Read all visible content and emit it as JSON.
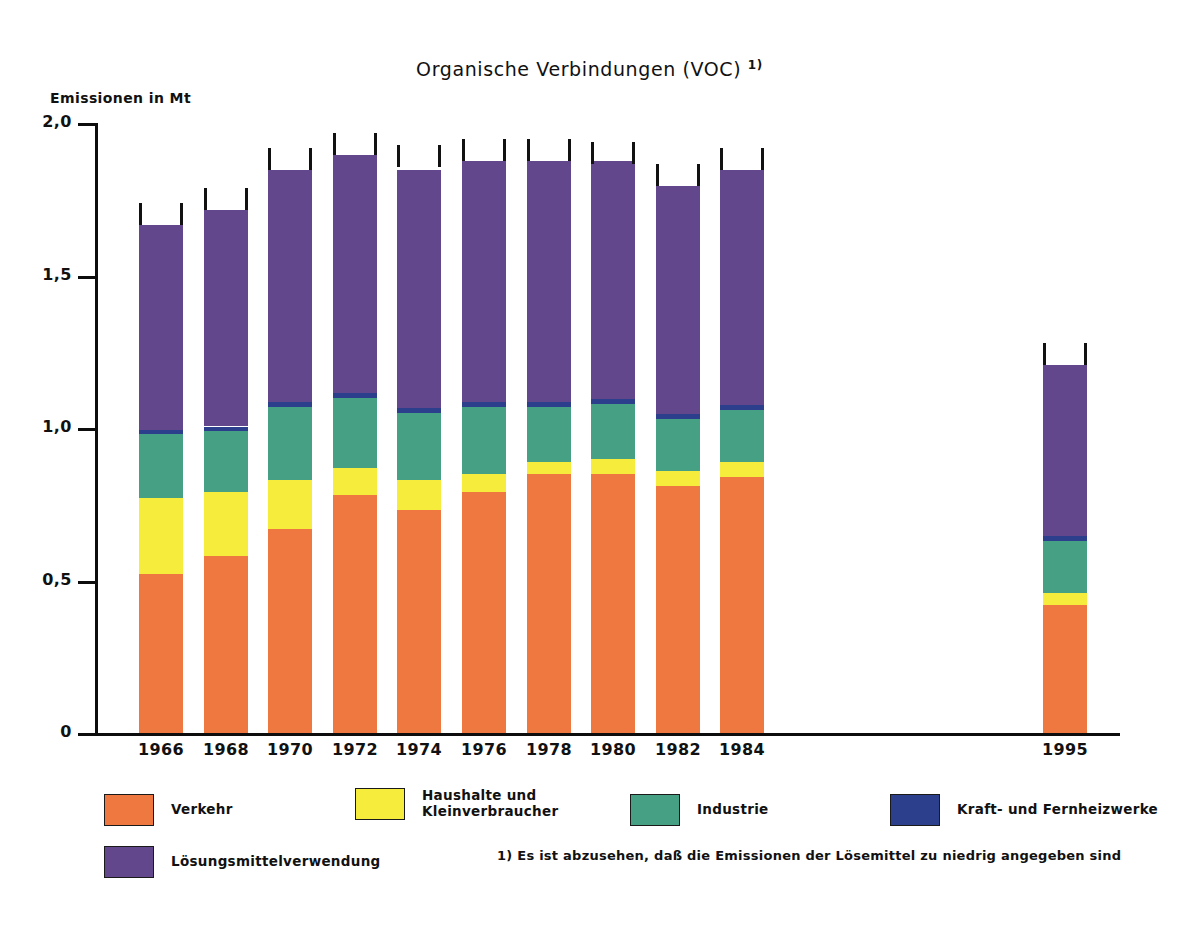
{
  "chart_data": {
    "type": "bar",
    "subtype": "stacked-bar",
    "title": "Organische Verbindungen (VOC)",
    "title_superscript": "1)",
    "xlabel": "",
    "ylabel": "Emissionen in Mt",
    "ylim": [
      0,
      2.0
    ],
    "ytick_labels": [
      "0",
      "0,5",
      "1,0",
      "1,5",
      "2,0"
    ],
    "ytick_values": [
      0,
      0.5,
      1.0,
      1.5,
      2.0
    ],
    "grid": false,
    "legend_position": "bottom",
    "categories": [
      "1966",
      "1968",
      "1970",
      "1972",
      "1974",
      "1976",
      "1978",
      "1980",
      "1982",
      "1984",
      "1995"
    ],
    "series": [
      {
        "name": "Verkehr",
        "color": "#ee7840",
        "values": [
          0.52,
          0.58,
          0.67,
          0.78,
          0.73,
          0.79,
          0.85,
          0.85,
          0.81,
          0.84,
          0.42
        ]
      },
      {
        "name": "Haushalte und\nKleinverbraucher",
        "color": "#f6ec3c",
        "values": [
          0.25,
          0.21,
          0.16,
          0.09,
          0.1,
          0.06,
          0.04,
          0.05,
          0.05,
          0.05,
          0.04
        ]
      },
      {
        "name": "Industrie",
        "color": "#46a184",
        "values": [
          0.21,
          0.2,
          0.24,
          0.23,
          0.22,
          0.22,
          0.18,
          0.18,
          0.17,
          0.17,
          0.17
        ]
      },
      {
        "name": "Kraft- und Fernheizwerke",
        "color": "#2b3f8c",
        "values": [
          0.015,
          0.015,
          0.015,
          0.015,
          0.015,
          0.015,
          0.015,
          0.015,
          0.015,
          0.015,
          0.015
        ]
      },
      {
        "name": "Lösungsmittelverwendung",
        "color": "#63478c",
        "values": [
          0.67,
          0.71,
          0.76,
          0.78,
          0.78,
          0.79,
          0.79,
          0.78,
          0.75,
          0.77,
          0.56
        ]
      }
    ],
    "totals": [
      1.665,
      1.715,
      1.845,
      1.895,
      1.855,
      1.875,
      1.875,
      1.865,
      1.795,
      1.845,
      1.205
    ],
    "annotations": [
      "Bars carry a bracket/whisker cap above each column top"
    ]
  },
  "legend": {
    "items": [
      {
        "label": "Verkehr",
        "color": "#ee7840",
        "name": "verkehr"
      },
      {
        "label": "Haushalte und\nKleinverbraucher",
        "color": "#f6ec3c",
        "name": "haushalte-kleinverbraucher"
      },
      {
        "label": "Industrie",
        "color": "#46a184",
        "name": "industrie"
      },
      {
        "label": "Kraft- und Fernheizwerke",
        "color": "#2b3f8c",
        "name": "kraft-fernheizwerke"
      },
      {
        "label": "Lösungsmittelverwendung",
        "color": "#63478c",
        "name": "loesungsmittelverwendung"
      }
    ]
  },
  "footnote": "1) Es ist abzusehen, daß die Emissionen der Lösemittel zu niedrig angegeben sind"
}
